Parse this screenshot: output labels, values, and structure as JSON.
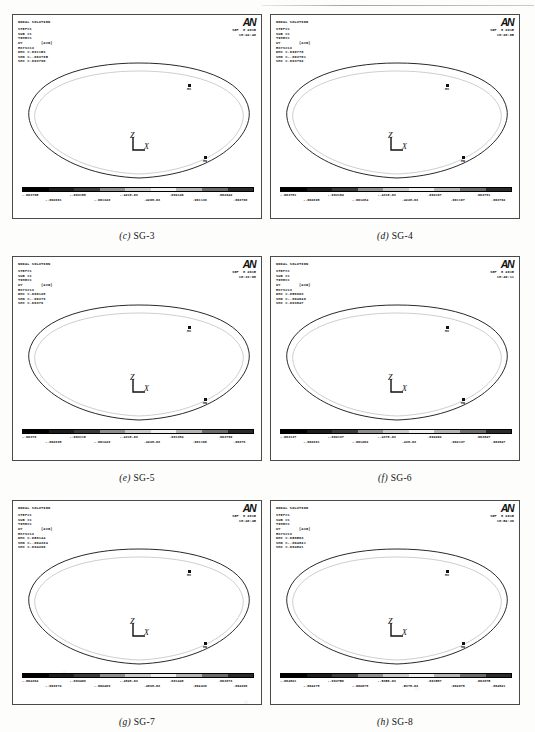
{
  "page": {
    "figure_type": "ANSYS nodal solution contour plots",
    "grid": "3 rows x 2 columns"
  },
  "colorbar": {
    "band_colors": [
      "#000000",
      "#1c1c1c",
      "#3a3a3a",
      "#8e8e8e",
      "#c9c9c9",
      "#efefef",
      "#b4b4b4",
      "#6b6b6b",
      "#2a2a2a"
    ]
  },
  "markers": {
    "max_label": "MX",
    "min_label": "MN"
  },
  "axes": {
    "z_label": "Z",
    "x_label": "X"
  },
  "panels": [
    {
      "id": "panel-c",
      "caption_letter": "(c)",
      "caption_text": "SG-3",
      "title": "NODAL SOLUTION",
      "lines": [
        "STEP=1",
        "SUB =1",
        "TIME=1",
        "UY        (AVG)",
        "RSYS=13",
        "DMX =.061153",
        "SMN =-.003795",
        "SMX =.003790"
      ],
      "logo": "AN",
      "date": "SEP  8 2015",
      "time": "18:22:40",
      "ticks_upper": [
        "-.003795",
        "-.003188",
        "-.4218-03",
        ".002140",
        ".002942"
      ],
      "ticks_lower": [
        "-.002961",
        "-.001349",
        ".4208-03",
        ".001139",
        ".003790"
      ]
    },
    {
      "id": "panel-d",
      "caption_letter": "(d)",
      "caption_text": "SG-4",
      "title": "NODAL SOLUTION",
      "lines": [
        "STEP=1",
        "SUB =1",
        "TIME=1",
        "UY        (AVG)",
        "RSYS=13",
        "DMX =.060770",
        "SMN =-.003781",
        "SMX =.003792"
      ],
      "logo": "AN",
      "date": "SEP  8 2015",
      "time": "18:28:05",
      "ticks_upper": [
        "-.003781",
        "-.003184",
        "-.4318-03",
        ".002107",
        ".003791"
      ],
      "ticks_lower": [
        "-.002998",
        "-.001284",
        ".4228-03",
        ".001107",
        ".003792"
      ]
    },
    {
      "id": "panel-e",
      "caption_letter": "(e)",
      "caption_text": "SG-5",
      "title": "NODAL SOLUTION",
      "lines": [
        "STEP=1",
        "SUB =1",
        "TIME=1",
        "UY        (AVG)",
        "RSYS=13",
        "DMX =.060128",
        "SMN =-.00379",
        "SMX =.00379"
      ],
      "logo": "AN",
      "date": "SEP  8 2015",
      "time": "18:33:08",
      "ticks_upper": [
        "-.00379",
        "-.003118",
        "-.4318-03",
        ".001384",
        ".003790"
      ],
      "ticks_lower": [
        "-.002998",
        "-.001249",
        ".4228-03",
        ".001106",
        ".00379"
      ]
    },
    {
      "id": "panel-f",
      "caption_letter": "(f)",
      "caption_text": "SG-6",
      "title": "NODAL SOLUTION",
      "lines": [
        "STEP=1",
        "SUB =1",
        "TIME=1",
        "UY        (AVG)",
        "RSYS=13",
        "DMX =.056903",
        "SMN =-.004046",
        "SMX =.003847"
      ],
      "logo": "AN",
      "date": "SEP  8 2015",
      "time": "18:40:11",
      "ticks_upper": [
        "-.003137",
        "-.002137",
        "-.4378-03",
        ".002202",
        ".003847"
      ],
      "ticks_lower": [
        "-.002991",
        "-.001202",
        ".438-03",
        ".002137",
        ".003847"
      ]
    },
    {
      "id": "panel-g",
      "caption_letter": "(g)",
      "caption_text": "SG-7",
      "title": "NODAL SOLUTION",
      "lines": [
        "STEP=1",
        "SUB =1",
        "TIME=1",
        "UY        (AVG)",
        "RSYS=13",
        "DMX =.059144",
        "SMN =-.004394",
        "SMX =.004396"
      ],
      "logo": "AN",
      "date": "SEP  8 2015",
      "time": "18:46:45",
      "ticks_upper": [
        "-.004394",
        "-.003409",
        "-.4828-03",
        ".001448",
        ".003973"
      ],
      "ticks_lower": [
        "-.003972",
        "-.002409",
        ".4828-03",
        ".002439",
        ".004396"
      ]
    },
    {
      "id": "panel-h",
      "caption_letter": "(h)",
      "caption_text": "SG-8",
      "title": "NODAL SOLUTION",
      "lines": [
        "STEP=1",
        "SUB =1",
        "TIME=1",
        "UY        (AVG)",
        "RSYS=13",
        "DMX =.059563",
        "SMN =-.004821",
        "SMX =.004821"
      ],
      "logo": "AN",
      "date": "SEP  8 2015",
      "time": "18:52:36",
      "ticks_upper": [
        "-.004821",
        "-.003750",
        "-.5358-03",
        ".001587",
        ".003975"
      ],
      "ticks_lower": [
        "-.004278",
        "-.002078",
        ".5378-03",
        ".002078",
        ".004821"
      ]
    }
  ]
}
